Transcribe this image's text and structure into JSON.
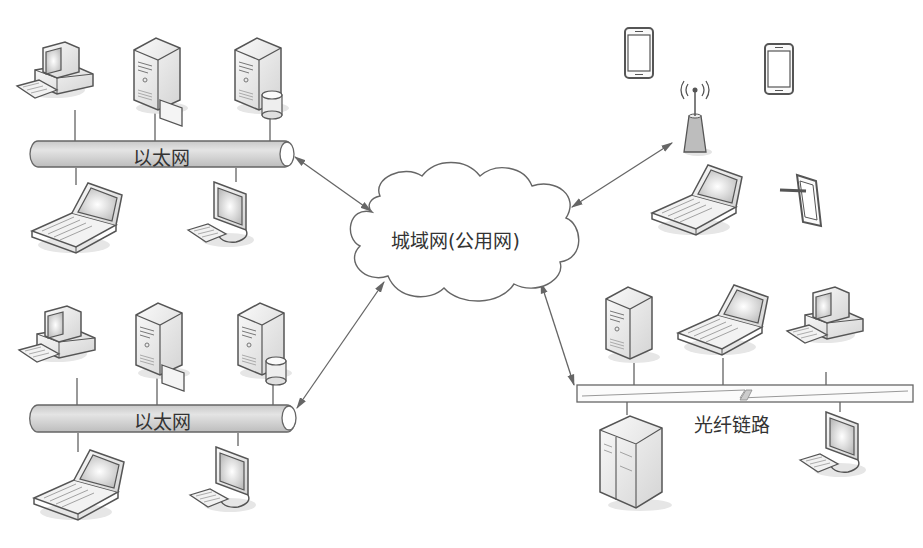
{
  "diagram": {
    "title": "",
    "center_cloud": {
      "label": "城域网(公用网)"
    },
    "networks": [
      {
        "id": "lan-top",
        "label": "以太网",
        "type": "ethernet-bus",
        "nodes_above": [
          "desktop-pc",
          "server-with-card",
          "database-server"
        ],
        "nodes_below": [
          "laptop",
          "lcd-workstation"
        ]
      },
      {
        "id": "lan-bottom",
        "label": "以太网",
        "type": "ethernet-bus",
        "nodes_above": [
          "desktop-pc",
          "server-with-card",
          "database-server"
        ],
        "nodes_below": [
          "laptop",
          "lcd-workstation"
        ]
      },
      {
        "id": "wireless",
        "label": "",
        "type": "wireless-access-point",
        "nodes": [
          "smartphone",
          "smartphone",
          "wireless-antenna",
          "laptop",
          "tablet"
        ]
      },
      {
        "id": "fiber",
        "label": "光纤链路",
        "type": "fiber-link",
        "nodes_above": [
          "tower-server",
          "laptop",
          "desktop-pc"
        ],
        "nodes_below": [
          "rack-server",
          "lcd-workstation"
        ]
      }
    ],
    "connections": [
      {
        "from": "lan-top",
        "to": "center_cloud",
        "style": "double-arrow"
      },
      {
        "from": "lan-bottom",
        "to": "center_cloud",
        "style": "double-arrow"
      },
      {
        "from": "wireless",
        "to": "center_cloud",
        "style": "double-arrow"
      },
      {
        "from": "fiber",
        "to": "center_cloud",
        "style": "double-arrow"
      }
    ],
    "colors": {
      "line": "#555555",
      "pipe_fill": "#d6d6d6",
      "device_fill": "#eeeeee",
      "device_stroke": "#555555"
    }
  }
}
